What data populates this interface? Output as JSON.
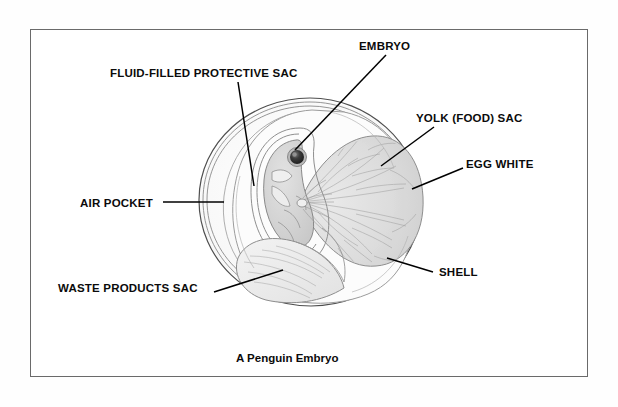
{
  "figure": {
    "caption": "A Penguin Embryo",
    "frame_color": "#6a6a6a",
    "background_color": "#ffffff",
    "ink_color": "#0b0b0b"
  },
  "labels": [
    {
      "id": "embryo",
      "text": "EMBRYO",
      "x": 359,
      "y": 41,
      "anchor": "left"
    },
    {
      "id": "fluid_sac",
      "text": "FLUID-FILLED PROTECTIVE SAC",
      "x": 110,
      "y": 68,
      "anchor": "left"
    },
    {
      "id": "yolk_sac",
      "text": "YOLK (FOOD) SAC",
      "x": 416,
      "y": 113,
      "anchor": "left"
    },
    {
      "id": "egg_white",
      "text": "EGG WHITE",
      "x": 466,
      "y": 159,
      "anchor": "left"
    },
    {
      "id": "air_pocket",
      "text": "AIR POCKET",
      "x": 80,
      "y": 198,
      "anchor": "left"
    },
    {
      "id": "shell",
      "text": "SHELL",
      "x": 439,
      "y": 267,
      "anchor": "left"
    },
    {
      "id": "waste_sac",
      "text": "WASTE PRODUCTS SAC",
      "x": 58,
      "y": 283,
      "anchor": "left"
    }
  ],
  "leader_lines": [
    {
      "id": "embryo-leader",
      "x1": 386,
      "y1": 55,
      "x2": 295,
      "y2": 150
    },
    {
      "id": "fluid-sac-leader",
      "x1": 238,
      "y1": 82,
      "x2": 254,
      "y2": 186
    },
    {
      "id": "yolk-leader",
      "x1": 434,
      "y1": 127,
      "x2": 381,
      "y2": 166
    },
    {
      "id": "egg-white-leader",
      "x1": 463,
      "y1": 168,
      "x2": 412,
      "y2": 189
    },
    {
      "id": "air-pocket-leader",
      "x1": 163,
      "y1": 202,
      "x2": 224,
      "y2": 202
    },
    {
      "id": "shell-leader",
      "x1": 433,
      "y1": 272,
      "x2": 387,
      "y2": 258
    },
    {
      "id": "waste-sac-leader",
      "x1": 214,
      "y1": 292,
      "x2": 283,
      "y2": 270
    }
  ],
  "illustration": {
    "name": "egg-cross-section",
    "description": "Cut-away side view of a penguin egg showing shell, egg white, air pocket, fluid-filled protective sac, embryo, yolk sac and waste products sac",
    "parts": [
      "shell-outline",
      "shell-membrane",
      "egg-white",
      "air-pocket",
      "amniotic-sac",
      "embryo-body",
      "embryo-eye",
      "yolk-sac",
      "yolk-veins",
      "allantois-waste-sac"
    ],
    "colors": {
      "shell_line": "#555555",
      "membrane_line": "#7b7b7b",
      "egg_white": "#fbfbfb",
      "yolk_fill": "#dcdcdc",
      "yolk_vein": "#9a9a9a",
      "embryo_fill": "#d2d2d2",
      "embryo_eye": "#2b2b2b",
      "waste_fill": "#ededed"
    }
  }
}
